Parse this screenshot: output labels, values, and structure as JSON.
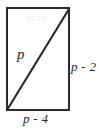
{
  "figure": {
    "kind": "geometry-diagram",
    "background_color": "#ffffff",
    "stroke_color": "#2b2b2b",
    "text_color": "#2b2b2b",
    "shape": {
      "name": "rectangle",
      "x": 7,
      "y": 8,
      "width": 62,
      "height": 102,
      "stroke_width": 2
    },
    "diagonal": {
      "name": "diagonal-line",
      "x1": 7,
      "y1": 110,
      "x2": 69,
      "y2": 9,
      "stroke_width": 2
    },
    "labels": {
      "diagonal": "p",
      "right_side": "p - 2",
      "bottom_side": "p - 4"
    },
    "artifacts": {
      "watermark_text": "scan"
    }
  }
}
